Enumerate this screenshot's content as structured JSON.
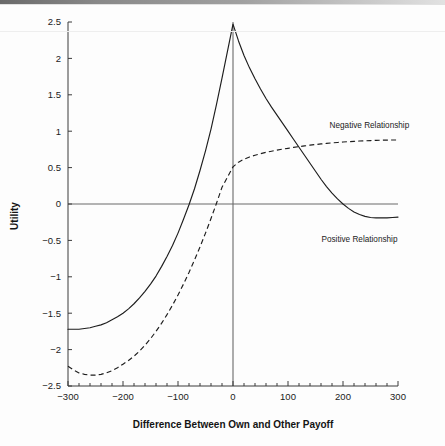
{
  "figure": {
    "background_color": "#fdfdfd",
    "line_color": "#1d1d1d",
    "axis_color": "#3b3b3b",
    "zero_line_color": "#6a6a6a"
  },
  "chart_data": {
    "type": "line",
    "title": "",
    "xlabel": "Difference Between Own and Other Payoff",
    "ylabel": "Utility",
    "xlim": [
      -300,
      300
    ],
    "ylim": [
      -2.5,
      2.5
    ],
    "xticks": [
      -300,
      -200,
      -100,
      0,
      100,
      200,
      300
    ],
    "xtick_labels": [
      "−300",
      "−200",
      "−100",
      "0",
      "100",
      "200",
      "300"
    ],
    "xminor_tick_step": 20,
    "yticks": [
      2.5,
      2,
      1.5,
      1,
      0.5,
      0,
      -0.5,
      -1,
      -1.5,
      -2,
      -2.5
    ],
    "ytick_labels": [
      "2.5",
      "2",
      "1.5",
      "1",
      "0.5",
      "0",
      "−0.5",
      "−1",
      "−1.5",
      "−2",
      "−2.5"
    ],
    "grid": false,
    "legend_position": "inline-annotations",
    "zero_horizontal_line": 0,
    "zero_vertical_line": 0,
    "series": [
      {
        "name": "Positive Relationship",
        "style": "solid",
        "label": "Positive Relationship",
        "label_x": 230,
        "label_y": -0.52,
        "x": [
          -300,
          -290,
          -280,
          -270,
          -260,
          -250,
          -240,
          -230,
          -220,
          -210,
          -200,
          -190,
          -180,
          -170,
          -160,
          -150,
          -140,
          -130,
          -120,
          -110,
          -100,
          -90,
          -80,
          -70,
          -60,
          -50,
          -40,
          -30,
          -20,
          -10,
          0,
          10,
          20,
          30,
          40,
          50,
          60,
          70,
          80,
          90,
          100,
          110,
          120,
          130,
          140,
          150,
          160,
          170,
          180,
          190,
          200,
          210,
          220,
          230,
          240,
          250,
          260,
          270,
          280,
          290,
          300
        ],
        "y": [
          -1.72,
          -1.72,
          -1.72,
          -1.71,
          -1.7,
          -1.68,
          -1.66,
          -1.63,
          -1.59,
          -1.55,
          -1.5,
          -1.44,
          -1.37,
          -1.29,
          -1.2,
          -1.1,
          -0.99,
          -0.86,
          -0.72,
          -0.57,
          -0.4,
          -0.21,
          -0.01,
          0.21,
          0.46,
          0.73,
          1.03,
          1.37,
          1.73,
          2.1,
          2.47,
          2.24,
          2.04,
          1.87,
          1.72,
          1.58,
          1.45,
          1.33,
          1.22,
          1.11,
          1.0,
          0.89,
          0.78,
          0.67,
          0.56,
          0.45,
          0.34,
          0.24,
          0.15,
          0.07,
          0.0,
          -0.06,
          -0.11,
          -0.145,
          -0.17,
          -0.185,
          -0.19,
          -0.19,
          -0.19,
          -0.185,
          -0.18
        ]
      },
      {
        "name": "Negative Relationship",
        "style": "dashed",
        "label": "Negative Relationship",
        "label_x": 248,
        "label_y": 1.05,
        "x": [
          -300,
          -290,
          -280,
          -270,
          -260,
          -250,
          -240,
          -230,
          -220,
          -210,
          -200,
          -190,
          -180,
          -170,
          -160,
          -150,
          -140,
          -130,
          -120,
          -110,
          -100,
          -90,
          -80,
          -70,
          -60,
          -50,
          -40,
          -30,
          -20,
          -10,
          0,
          10,
          20,
          30,
          40,
          50,
          60,
          70,
          80,
          90,
          100,
          110,
          120,
          130,
          140,
          150,
          160,
          170,
          180,
          190,
          200,
          210,
          220,
          230,
          240,
          250,
          260,
          270,
          280,
          290,
          300
        ],
        "y": [
          -2.23,
          -2.28,
          -2.32,
          -2.34,
          -2.35,
          -2.35,
          -2.34,
          -2.32,
          -2.29,
          -2.25,
          -2.2,
          -2.15,
          -2.09,
          -2.02,
          -1.94,
          -1.85,
          -1.75,
          -1.64,
          -1.52,
          -1.39,
          -1.25,
          -1.1,
          -0.94,
          -0.77,
          -0.59,
          -0.4,
          -0.2,
          0.01,
          0.23,
          0.37,
          0.51,
          0.575,
          0.615,
          0.645,
          0.67,
          0.69,
          0.71,
          0.725,
          0.74,
          0.753,
          0.765,
          0.777,
          0.788,
          0.798,
          0.808,
          0.817,
          0.825,
          0.832,
          0.839,
          0.845,
          0.851,
          0.856,
          0.861,
          0.865,
          0.868,
          0.871,
          0.874,
          0.876,
          0.878,
          0.879,
          0.88
        ]
      }
    ]
  }
}
